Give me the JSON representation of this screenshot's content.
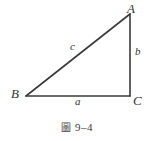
{
  "figure": {
    "type": "right-triangle-diagram",
    "background_color": "#ffffff",
    "stroke_color": "#3a3a3a",
    "text_color": "#333333",
    "vertices": [
      {
        "name": "A",
        "label": "A",
        "x": 130,
        "y": 14
      },
      {
        "name": "B",
        "label": "B",
        "x": 26,
        "y": 96
      },
      {
        "name": "C",
        "label": "C",
        "x": 130,
        "y": 96
      }
    ],
    "sides": [
      {
        "name": "a",
        "label": "a",
        "from": "B",
        "to": "C",
        "position": "bottom"
      },
      {
        "name": "b",
        "label": "b",
        "from": "C",
        "to": "A",
        "position": "right"
      },
      {
        "name": "c",
        "label": "c",
        "from": "B",
        "to": "A",
        "position": "hypotenuse"
      }
    ],
    "caption": {
      "figure_word": "圖",
      "number": "9–4",
      "full": "圖 9–4"
    }
  }
}
